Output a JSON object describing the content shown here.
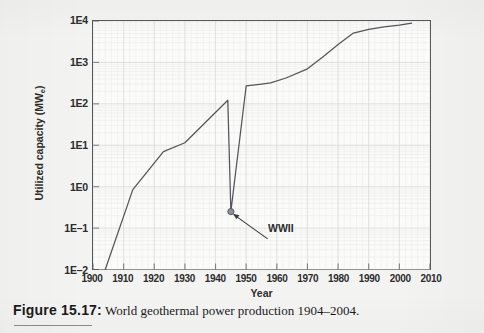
{
  "figure": {
    "caption_label": "Figure 15.17:",
    "caption_text": " World geothermal power production 1904–2004."
  },
  "chart_data": {
    "type": "line",
    "title": "",
    "subtitle": "",
    "xlabel": "Year",
    "ylabel": "Utilized capacity (MWe)",
    "ylabel_base": "Utilized capacity (MW",
    "ylabel_sub": "e",
    "ylabel_tail": ")",
    "yscale": "log",
    "xlim": [
      1900,
      2010
    ],
    "ylim": [
      0.01,
      10000
    ],
    "grid": true,
    "legend": "none",
    "xticks": [
      1900,
      1910,
      1920,
      1930,
      1940,
      1950,
      1960,
      1970,
      1980,
      1990,
      2000,
      2010
    ],
    "xtick_labels": [
      "1900",
      "1910",
      "1920",
      "1930",
      "1940",
      "1950",
      "1960",
      "1970",
      "1980",
      "1990",
      "2000",
      "2010"
    ],
    "yticks": [
      0.01,
      0.1,
      1,
      10,
      100,
      1000,
      10000
    ],
    "ytick_labels": [
      "1E–2",
      "1E–1",
      "1E0",
      "1E1",
      "1E2",
      "1E3",
      "1E4"
    ],
    "series": [
      {
        "name": "World geothermal power production",
        "color": "#52555a",
        "x": [
          1904,
          1913,
          1923,
          1930,
          1944,
          1945,
          1950,
          1955,
          1958,
          1963,
          1970,
          1975,
          1980,
          1985,
          1990,
          1995,
          2000,
          2004
        ],
        "y": [
          0.01,
          0.85,
          7.0,
          11.5,
          122,
          0.25,
          270,
          300,
          320,
          420,
          700,
          1350,
          2700,
          5100,
          6300,
          7200,
          8000,
          8900
        ]
      }
    ],
    "annotations": [
      {
        "name": "wwii",
        "label": "WWII",
        "point_x": 1945,
        "point_y": 0.25,
        "label_x": 1957,
        "label_y": 0.055,
        "marker": "dot"
      }
    ]
  }
}
